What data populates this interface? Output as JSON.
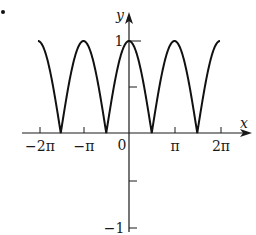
{
  "panel_marker": ".",
  "chart_data": {
    "type": "line",
    "title": "",
    "function": "y = |cos x|",
    "xlabel": "x",
    "ylabel": "y",
    "xlim": [
      -6.2832,
      6.2832
    ],
    "ylim": [
      -1,
      1
    ],
    "grid": false,
    "legend": null,
    "x_ticks": [
      {
        "value": -6.2832,
        "label": "−2π"
      },
      {
        "value": -3.1416,
        "label": "−π"
      },
      {
        "value": 0,
        "label": "0"
      },
      {
        "value": 3.1416,
        "label": "π"
      },
      {
        "value": 6.2832,
        "label": "2π"
      }
    ],
    "y_ticks": [
      {
        "value": 1,
        "label": "1"
      },
      {
        "value": 0.5,
        "label": ""
      },
      {
        "value": -0.5,
        "label": ""
      },
      {
        "value": -1,
        "label": "−1"
      }
    ],
    "series": [
      {
        "name": "|cos x|",
        "color": "#111111",
        "x": [
          -6.2832,
          -4.7124,
          -3.1416,
          -1.5708,
          0,
          1.5708,
          3.1416,
          4.7124,
          6.2832
        ],
        "y": [
          1,
          0,
          1,
          0,
          1,
          0,
          1,
          0,
          1
        ]
      }
    ]
  },
  "labels": {
    "x_axis": "x",
    "y_axis": "y",
    "tick_neg2pi": "−2π",
    "tick_negpi": "−π",
    "tick_zero": "0",
    "tick_pi": "π",
    "tick_2pi": "2π",
    "tick_y1": "1",
    "tick_yneg1": "−1"
  }
}
